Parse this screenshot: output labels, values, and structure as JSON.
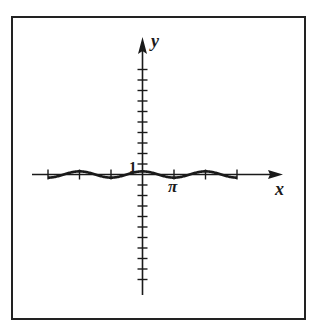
{
  "chart_data": {
    "type": "line",
    "title": "",
    "xlabel": "x",
    "ylabel": "y",
    "x_tick_label": "π",
    "y_tick_label": "1",
    "x_ticks": [
      "-3π",
      "-2π",
      "-π",
      "π",
      "2π",
      "3π"
    ],
    "x_tick_labels_shown": {
      "π": "π"
    },
    "y_ticks_above": 10,
    "y_ticks_below": 10,
    "y_tick_step": 1,
    "xlim": [
      -3.1416,
      3.1416
    ],
    "x_range_multiples_of_pi": [
      -3,
      3
    ],
    "ylim": [
      -11,
      11
    ],
    "grid": false,
    "legend": null,
    "series": [
      {
        "name": "curve",
        "description": "small-amplitude cosine-like wave, peak at x=0, troughs at ±π, ±3π, peaks at ±2π",
        "x_multiples_of_pi": [
          -3,
          -2.5,
          -2,
          -1.5,
          -1,
          -0.5,
          0,
          0.5,
          1,
          1.5,
          2,
          2.5,
          3
        ],
        "y": [
          -0.3,
          0,
          0.3,
          0,
          -0.3,
          0,
          0.3,
          0,
          -0.3,
          0,
          0.3,
          0,
          -0.3
        ]
      }
    ]
  },
  "labels": {
    "x_axis": "x",
    "y_axis": "y",
    "one": "1",
    "pi": "π"
  }
}
